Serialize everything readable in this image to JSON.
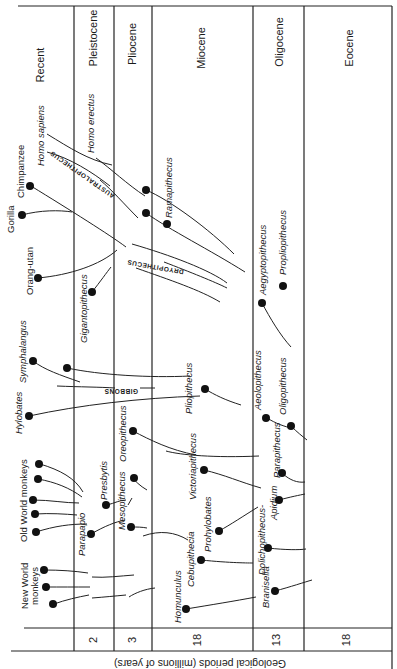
{
  "title_axis": "Geological periods (millions of years)",
  "epochs": [
    {
      "name": "Recent",
      "duration": ""
    },
    {
      "name": "Pleistocene",
      "duration": "2"
    },
    {
      "name": "Pliocene",
      "duration": "3"
    },
    {
      "name": "Miocene",
      "duration": "18"
    },
    {
      "name": "Oligocene",
      "duration": "13"
    },
    {
      "name": "Eocene",
      "duration": "18"
    }
  ],
  "living_groups": {
    "new_world_monkeys": "New World monkeys",
    "new_world_line1": "New World",
    "new_world_line2": "monkeys",
    "old_world_monkeys": "Old World monkeys",
    "hylobates": "Hylobates",
    "symphalangus": "Symphalangus",
    "orang_utan": "Orang-utan",
    "gorilla": "Gorilla",
    "chimpanzee": "Chimpanzee",
    "homo_sapiens": "Homo sapiens"
  },
  "fossils": {
    "homo_erectus": "Homo erectus",
    "gigantopithecus": "Gigantopithecus",
    "parapapio": "Parapapio",
    "presbytis": "Presbytis",
    "mesopithecus": "Mesopithecus",
    "oreopithecus": "Oreopithecus",
    "ramapithecus": "Ramapithecus",
    "pliopithecus": "Pliopithecus",
    "victoriapithecus": "Victoriapithecus",
    "prohylobates": "Prohylobates",
    "cebupithecia": "Cebupithecia",
    "homunculus": "Homunculus",
    "aegyptopithecus": "Aegyptopithecus",
    "propliopithecus": "Propliopithecus",
    "aeolopithecus": "Aeolopithecus",
    "oligopithecus": "Oligopithecus",
    "parapithecus": "Parapithecus",
    "apidium": "Apidium",
    "dolichopithecus": "Dolichopithecus-",
    "branisella": "Branisella"
  },
  "lineage_captions": {
    "australopithecus": "AUSTRALOPITHECUS",
    "dryopithecus": "DRYOPITHECUS",
    "gibbons": "GIBBONS"
  }
}
